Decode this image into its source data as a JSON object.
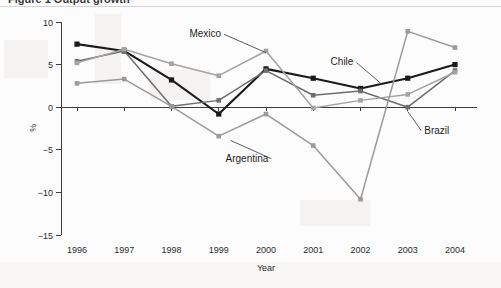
{
  "figure": {
    "caption_sliver": "Figure 1  Output growth",
    "background_color": "#fcfcfc"
  },
  "chart_data": {
    "type": "line",
    "title": "",
    "subtitle": "",
    "xlabel": "Year",
    "ylabel": "%",
    "categories": [
      "1996",
      "1997",
      "1998",
      "1999",
      "2000",
      "2001",
      "2002",
      "2003",
      "2004"
    ],
    "x": [
      1996,
      1997,
      1998,
      1999,
      2000,
      2001,
      2002,
      2003,
      2004
    ],
    "ylim": [
      -15,
      10
    ],
    "yticks": [
      10,
      5,
      0,
      -5,
      -10,
      -15
    ],
    "ytick_labels": [
      "10",
      "5",
      "0",
      "−5",
      "−10",
      "−15"
    ],
    "grid": false,
    "legend_position": "inline-annotations",
    "zero_line": true,
    "series": [
      {
        "name": "Chile",
        "color": "#1a1a1a",
        "marker": "square",
        "values": [
          7.4,
          6.6,
          3.2,
          -0.8,
          4.5,
          3.4,
          2.2,
          3.4,
          5.0
        ]
      },
      {
        "name": "Brazil",
        "color": "#6e6e6e",
        "marker": "square",
        "values": [
          5.4,
          6.6,
          0.1,
          0.8,
          4.3,
          1.4,
          1.9,
          0.0,
          4.3
        ]
      },
      {
        "name": "Mexico",
        "color": "#a3a3a3",
        "marker": "square",
        "values": [
          5.2,
          6.8,
          5.1,
          3.7,
          6.6,
          -0.1,
          0.8,
          1.5,
          4.1
        ]
      },
      {
        "name": "Argentina",
        "color": "#9a9a9a",
        "marker": "square",
        "values": [
          2.8,
          3.3,
          0.1,
          -3.4,
          -0.8,
          -4.5,
          -10.8,
          8.9,
          7.0
        ]
      }
    ],
    "annotations": [
      {
        "text": "Mexico",
        "x": 1999.05,
        "y": 8.2,
        "anchor": "end",
        "leader_to_x": 2000.0,
        "leader_to_y": 6.4
      },
      {
        "text": "Chile",
        "x": 2001.85,
        "y": 4.9,
        "anchor": "end",
        "leader_to_x": 2002.45,
        "leader_to_y": 2.7
      },
      {
        "text": "Brazil",
        "x": 2003.35,
        "y": -3.1,
        "anchor": "start",
        "leader_to_x": 2003.0,
        "leader_to_y": -0.5
      },
      {
        "text": "Argentina",
        "x": 2000.05,
        "y": -6.4,
        "anchor": "end",
        "leader_to_x": 1999.25,
        "leader_to_y": -3.9
      }
    ]
  }
}
